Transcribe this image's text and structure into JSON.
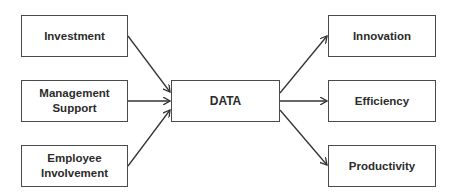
{
  "diagram": {
    "inputs": [
      {
        "id": "investment",
        "label": "Investment"
      },
      {
        "id": "management",
        "label": "Management Support",
        "lines": [
          "Management",
          "Support"
        ]
      },
      {
        "id": "employee",
        "label": "Employee Involvement",
        "lines": [
          "Employee",
          "Involvement"
        ]
      }
    ],
    "center": {
      "id": "data",
      "label": "DATA"
    },
    "outputs": [
      {
        "id": "innovation",
        "label": "Innovation"
      },
      {
        "id": "efficiency",
        "label": "Efficiency"
      },
      {
        "id": "productivity",
        "label": "Productivity"
      }
    ],
    "edges": [
      {
        "from": "Investment",
        "to": "DATA"
      },
      {
        "from": "Management Support",
        "to": "DATA"
      },
      {
        "from": "Employee Involvement",
        "to": "DATA"
      },
      {
        "from": "DATA",
        "to": "Innovation"
      },
      {
        "from": "DATA",
        "to": "Efficiency"
      },
      {
        "from": "DATA",
        "to": "Productivity"
      }
    ],
    "colors": {
      "stroke": "#333333",
      "text": "#2b2b2b",
      "background": "#ffffff"
    }
  }
}
